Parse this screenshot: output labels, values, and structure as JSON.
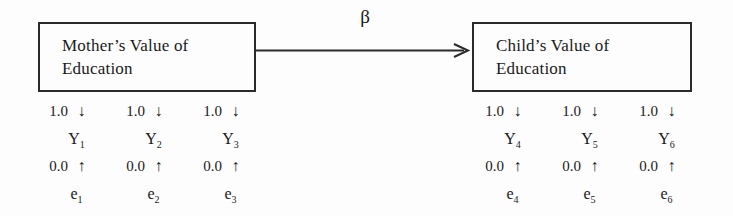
{
  "diagram": {
    "path_label": "β",
    "constructs": [
      {
        "id": "mother",
        "line1": "Mother’s Value of",
        "line2": "Education"
      },
      {
        "id": "child",
        "line1": "Child’s Value of",
        "line2": "Education"
      }
    ],
    "indicators": [
      {
        "loading": "1.0",
        "loading_arrow": "↓",
        "variable": "Y",
        "variable_sub": "1",
        "error_value": "0.0",
        "error_arrow": "↑",
        "error": "e",
        "error_sub": "1"
      },
      {
        "loading": "1.0",
        "loading_arrow": "↓",
        "variable": "Y",
        "variable_sub": "2",
        "error_value": "0.0",
        "error_arrow": "↑",
        "error": "e",
        "error_sub": "2"
      },
      {
        "loading": "1.0",
        "loading_arrow": "↓",
        "variable": "Y",
        "variable_sub": "3",
        "error_value": "0.0",
        "error_arrow": "↑",
        "error": "e",
        "error_sub": "3"
      },
      {
        "loading": "1.0",
        "loading_arrow": "↓",
        "variable": "Y",
        "variable_sub": "4",
        "error_value": "0.0",
        "error_arrow": "↑",
        "error": "e",
        "error_sub": "4"
      },
      {
        "loading": "1.0",
        "loading_arrow": "↓",
        "variable": "Y",
        "variable_sub": "5",
        "error_value": "0.0",
        "error_arrow": "↑",
        "error": "e",
        "error_sub": "5"
      },
      {
        "loading": "1.0",
        "loading_arrow": "↓",
        "variable": "Y",
        "variable_sub": "6",
        "error_value": "0.0",
        "error_arrow": "↑",
        "error": "e",
        "error_sub": "6"
      }
    ],
    "colors": {
      "stroke": "#2b2b2b",
      "text": "#1a1a1a",
      "background": "#fdfdfd"
    }
  }
}
